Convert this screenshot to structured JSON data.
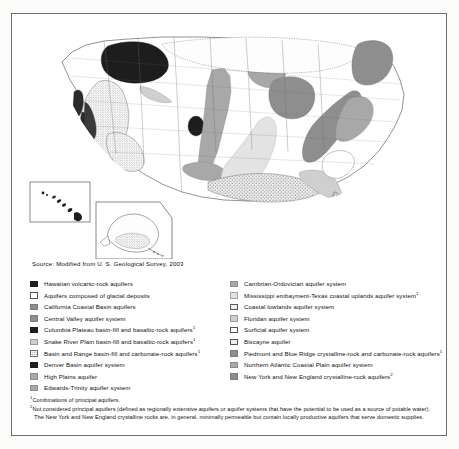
{
  "document": {
    "type": "map-figure",
    "title_visible": false,
    "source": "Source:  Modified from U. S. Geological Survey, 2003"
  },
  "map": {
    "name": "principal-aquifers-of-the-united-states",
    "insets": [
      {
        "name": "hawaii-inset",
        "label": ""
      },
      {
        "name": "alaska-inset",
        "label": ""
      }
    ]
  },
  "legend": {
    "left_column": [
      {
        "swatch": "solid-black",
        "label": "Hawaiian volcanic-rock aquifers",
        "footnote": ""
      },
      {
        "swatch": "white",
        "label": "Aquifers composed of glacial deposits",
        "footnote": ""
      },
      {
        "swatch": "dark-gray",
        "label": "California Coastal Basin aquifers",
        "footnote": ""
      },
      {
        "swatch": "dark-gray",
        "label": "Central Valley aquifer system",
        "footnote": ""
      },
      {
        "swatch": "solid-black",
        "label": "Columbia Plateau basin-fill and basaltic-rock aquifers",
        "footnote": "1"
      },
      {
        "swatch": "light-gray",
        "label": "Snake River Plain basin-fill and basaltic-rock aquifers",
        "footnote": "1"
      },
      {
        "swatch": "stipple",
        "label": "Basin and Range basin-fill and carbonate-rock aquifers",
        "footnote": "1"
      },
      {
        "swatch": "solid-black",
        "label": "Denver Basin aquifer system",
        "footnote": ""
      },
      {
        "swatch": "medium-gray",
        "label": "High Plains aquifer",
        "footnote": ""
      },
      {
        "swatch": "medium-gray",
        "label": "Edwards-Trinity aquifer system",
        "footnote": ""
      }
    ],
    "right_column": [
      {
        "swatch": "medium-gray",
        "label": "Cambrian-Ordovician aquifer system",
        "footnote": ""
      },
      {
        "swatch": "very-light-gray",
        "label": "Mississippi embayment-Texas coastal uplands aquifer system",
        "footnote": "1"
      },
      {
        "swatch": "dots",
        "label": "Coastal lowlands aquifer system",
        "footnote": ""
      },
      {
        "swatch": "light-gray",
        "label": "Floridan aquifer system",
        "footnote": ""
      },
      {
        "swatch": "white",
        "label": "Surficial aquifer system",
        "footnote": ""
      },
      {
        "swatch": "dots-dark",
        "label": "Biscayne aquifer",
        "footnote": ""
      },
      {
        "swatch": "dark-gray",
        "label": "Piedmont and Blue Ridge crystalline-rock and carbonate-rock aquifers",
        "footnote": "1"
      },
      {
        "swatch": "medium-gray",
        "label": "Northern Atlantic Coastal Plain aquifer system",
        "footnote": ""
      },
      {
        "swatch": "dark-gray",
        "label": "New York and New England crystalline-rock aquifers",
        "footnote": "2"
      }
    ]
  },
  "footnotes": [
    {
      "marker": "1",
      "line1": "Combinations of principal aquifers.",
      "line2": ""
    },
    {
      "marker": "2",
      "line1": "Not considered principal aquifers (defined as regionally extensive aquifers or aquifer systems that have the potential to be used as a source of potable water).",
      "line2": "The New York and New England crystalline rocks are, in general, minimally permeable but contain locally productive aquifers that serve domestic supplies."
    }
  ],
  "colors": {
    "solid_black": "#1d1d1d",
    "dark_gray": "#8e8e8e",
    "medium_gray": "#a8a8a8",
    "light_gray": "#cfcfcf",
    "very_light_gray": "#e3e3e3",
    "frame_border": "#6d6d6d",
    "page_background": "#ffffff"
  }
}
